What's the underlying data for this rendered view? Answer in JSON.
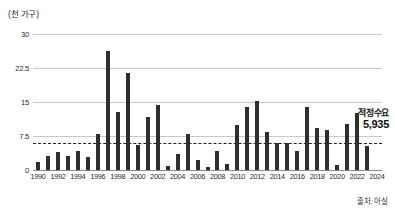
{
  "chart_data": {
    "type": "bar",
    "title": "",
    "unit_label": "(천 가구)",
    "xlabel": "",
    "ylabel": "",
    "ylim": [
      0,
      30
    ],
    "yticks": [
      "0",
      "7.5",
      "15",
      "22.5",
      "30"
    ],
    "ytick_values": [
      0,
      7.5,
      15,
      22.5,
      30
    ],
    "grid": true,
    "legend": "none",
    "categories": [
      "1990",
      "1991",
      "1992",
      "1993",
      "1994",
      "1995",
      "1996",
      "1997",
      "1998",
      "1999",
      "2000",
      "2001",
      "2002",
      "2003",
      "2004",
      "2005",
      "2006",
      "2007",
      "2008",
      "2009",
      "2010",
      "2011",
      "2012",
      "2013",
      "2014",
      "2015",
      "2016",
      "2017",
      "2018",
      "2019",
      "2020",
      "2021",
      "2022",
      "2023",
      "2024"
    ],
    "xtick_labels": [
      "1990",
      "1992",
      "1994",
      "1996",
      "1998",
      "2000",
      "2002",
      "2004",
      "2006",
      "2008",
      "2010",
      "2012",
      "2014",
      "2016",
      "2018",
      "2020",
      "2022",
      "2024"
    ],
    "values": [
      1.8,
      3.2,
      3.9,
      3.1,
      4.3,
      2.9,
      8.0,
      26.2,
      12.7,
      21.3,
      5.5,
      11.8,
      14.3,
      0.9,
      3.6,
      7.9,
      2.1,
      0.6,
      4.1,
      1.3,
      9.9,
      13.8,
      15.2,
      8.4,
      6.0,
      6.0,
      4.2,
      13.9,
      9.2,
      8.8,
      1.0,
      10.2,
      12.6,
      5.2,
      0
    ],
    "reference_line": {
      "label": "적정수요",
      "value_label": "5,935",
      "value": 5.935,
      "style": "dashed"
    },
    "source": "출처: 아실",
    "colors": {
      "bar": "#2e2e2e",
      "grid": "#c9c9c9",
      "axis": "#8a8a8a",
      "reference": "#1f1f1f",
      "text": "#1a1a1a"
    }
  }
}
